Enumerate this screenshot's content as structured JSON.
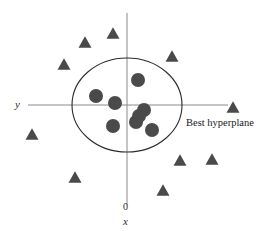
{
  "figure": {
    "background_color": "#ffffff"
  },
  "labels": {
    "y_axis": "y",
    "x_axis": "x",
    "origin": "0",
    "annotation": "Best hyperplane"
  },
  "chart_data": {
    "type": "scatter",
    "title": "",
    "xlabel": "x",
    "ylabel": "y",
    "grid": false,
    "legend": "none",
    "annotations": [
      {
        "text": "Best hyperplane",
        "px": 186,
        "py": 118,
        "target": "boundary-ellipse"
      }
    ],
    "axes": {
      "horizontal": {
        "x1": 28,
        "y1": 105,
        "x2": 228,
        "y2": 105,
        "color": "#8a8a8a"
      },
      "vertical": {
        "x1": 127,
        "y1": 13,
        "x2": 127,
        "y2": 205,
        "color": "#8a8a8a"
      },
      "origin": {
        "px": 127,
        "py": 105
      }
    },
    "boundary": {
      "shape": "ellipse",
      "cx": 127,
      "cy": 105,
      "rx": 55,
      "ry": 47,
      "stroke": "#2b2b2b",
      "fill": "none"
    },
    "series": [
      {
        "name": "class-inside",
        "marker": "circle",
        "color": "#4a4a4a",
        "radius": 7,
        "count": 8,
        "points": [
          {
            "px": 138,
            "py": 80
          },
          {
            "px": 96,
            "py": 96
          },
          {
            "px": 115,
            "py": 103
          },
          {
            "px": 144,
            "py": 110
          },
          {
            "px": 136,
            "py": 122
          },
          {
            "px": 113,
            "py": 126
          },
          {
            "px": 152,
            "py": 130
          },
          {
            "px": 139,
            "py": 116
          }
        ]
      },
      {
        "name": "class-outside",
        "marker": "triangle",
        "color": "#4a4a4a",
        "size": 13,
        "count": 10,
        "points": [
          {
            "px": 113,
            "py": 33
          },
          {
            "px": 85,
            "py": 42
          },
          {
            "px": 64,
            "py": 64
          },
          {
            "px": 172,
            "py": 56
          },
          {
            "px": 233,
            "py": 107
          },
          {
            "px": 32,
            "py": 134
          },
          {
            "px": 75,
            "py": 177
          },
          {
            "px": 180,
            "py": 160
          },
          {
            "px": 212,
            "py": 159
          },
          {
            "px": 163,
            "py": 190
          }
        ]
      }
    ]
  }
}
